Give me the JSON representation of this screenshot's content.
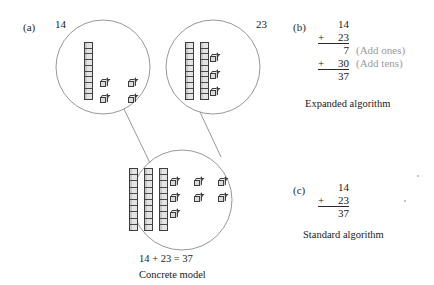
{
  "figure": {
    "panel_a": {
      "tag": "(a)",
      "addend1_label": "14",
      "addend2_label": "23",
      "equation": "14 + 23 = 37",
      "caption": "Concrete model",
      "circles": [
        {
          "name": "addend-one",
          "tens": 1,
          "ones": 4,
          "value": "14"
        },
        {
          "name": "addend-two",
          "tens": 2,
          "ones": 3,
          "value": "23"
        },
        {
          "name": "sum",
          "tens": 3,
          "ones": 7,
          "value": "37"
        }
      ]
    },
    "panel_b": {
      "tag": "(b)",
      "rows": [
        {
          "op": "",
          "digits": "14",
          "note": ""
        },
        {
          "op": "+",
          "digits": "23",
          "note": ""
        },
        {
          "op": "",
          "digits": "7",
          "note": "(Add ones)"
        },
        {
          "op": "+",
          "digits": "30",
          "note": "(Add tens)"
        },
        {
          "op": "",
          "digits": "37",
          "note": ""
        }
      ],
      "caption": "Expanded algorithm"
    },
    "panel_c": {
      "tag": "(c)",
      "rows": [
        {
          "op": "",
          "digits": "14"
        },
        {
          "op": "+",
          "digits": "23"
        },
        {
          "op": "",
          "digits": "37"
        }
      ],
      "caption": "Standard algorithm"
    },
    "colors": {
      "ink": "#1a1a1a",
      "rule": "#2a2a2a",
      "annotation": "#9a9a9a",
      "block_fill": "#dedede",
      "block_stroke": "#3d3d3d",
      "circle_stroke": "#8c8c8c",
      "background": "#ffffff"
    }
  }
}
